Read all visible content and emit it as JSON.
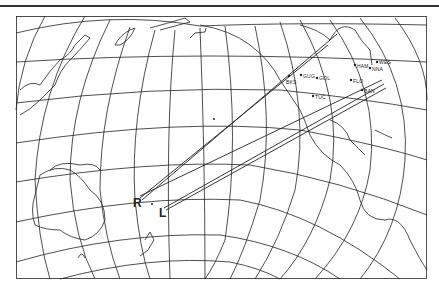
{
  "figure": {
    "type": "world map projection with great-circle paths",
    "stroke_color": "#222222",
    "background": "#ffffff"
  },
  "receivers": {
    "R": {
      "label": "R"
    },
    "L": {
      "label": "L"
    }
  },
  "stations": [
    {
      "label": "BKS"
    },
    {
      "label": "GUG"
    },
    {
      "label": "GOL"
    },
    {
      "label": "TUC"
    },
    {
      "label": "FLO"
    },
    {
      "label": "HAM"
    },
    {
      "label": "WES"
    },
    {
      "label": "NNA"
    },
    {
      "label": "BAN"
    }
  ]
}
